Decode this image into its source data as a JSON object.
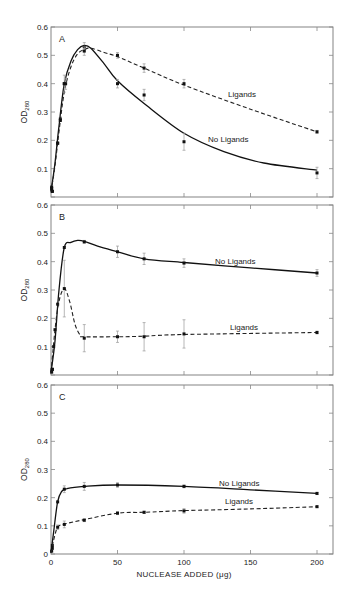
{
  "figure": {
    "x_axis_label": "NUCLEASE ADDED (μg)",
    "y_axis_label_main": "OD",
    "y_axis_label_sub": "280",
    "x_tick_labels": [
      "0",
      "50",
      "100",
      "150",
      "200"
    ],
    "y_tick_labels": [
      "0",
      "0.1",
      "0.2",
      "0.3",
      "0.4",
      "0.5",
      "0.6"
    ]
  },
  "chart_data": [
    {
      "type": "line",
      "panel": "A",
      "title": "A",
      "xlabel": "",
      "ylabel": "OD280",
      "xlim": [
        0,
        210
      ],
      "ylim": [
        0,
        0.6
      ],
      "grid": false,
      "layout": {
        "top": 27,
        "bottom": 197
      },
      "series": [
        {
          "name": "No Ligands",
          "style": "solid",
          "label_pos": [
            208,
            142
          ],
          "points": [
            {
              "x": 0.5,
              "y": 0.035
            },
            {
              "x": 1,
              "y": 0.02
            },
            {
              "x": 5,
              "y": 0.19
            },
            {
              "x": 7,
              "y": 0.275
            },
            {
              "x": 10,
              "y": 0.4
            },
            {
              "x": 25,
              "y": 0.53,
              "err": 0.015
            },
            {
              "x": 50,
              "y": 0.4,
              "err": 0.015
            },
            {
              "x": 70,
              "y": 0.36,
              "err": 0.02
            },
            {
              "x": 100,
              "y": 0.195,
              "err": 0.03
            },
            {
              "x": 200,
              "y": 0.085,
              "err": 0.02
            }
          ],
          "curve": [
            [
              0,
              0.02
            ],
            [
              3,
              0.12
            ],
            [
              6,
              0.25
            ],
            [
              10,
              0.4
            ],
            [
              15,
              0.48
            ],
            [
              20,
              0.52
            ],
            [
              25,
              0.535
            ],
            [
              30,
              0.525
            ],
            [
              40,
              0.47
            ],
            [
              50,
              0.41
            ],
            [
              70,
              0.33
            ],
            [
              100,
              0.225
            ],
            [
              130,
              0.16
            ],
            [
              160,
              0.12
            ],
            [
              200,
              0.095
            ]
          ]
        },
        {
          "name": "Ligands",
          "style": "dashed",
          "label_pos": [
            228,
            97
          ],
          "points": [
            {
              "x": 0.5,
              "y": 0.03
            },
            {
              "x": 1,
              "y": 0.02
            },
            {
              "x": 5,
              "y": 0.19
            },
            {
              "x": 7,
              "y": 0.27
            },
            {
              "x": 10,
              "y": 0.4,
              "err": 0.03
            },
            {
              "x": 11,
              "y": 0.4,
              "err": 0.02
            },
            {
              "x": 25,
              "y": 0.515,
              "err": 0.015
            },
            {
              "x": 50,
              "y": 0.5,
              "err": 0.01
            },
            {
              "x": 70,
              "y": 0.455,
              "err": 0.015
            },
            {
              "x": 100,
              "y": 0.4,
              "err": 0.015
            },
            {
              "x": 200,
              "y": 0.23,
              "err": 0.005
            }
          ],
          "curve": [
            [
              0,
              0.02
            ],
            [
              3,
              0.11
            ],
            [
              6,
              0.23
            ],
            [
              10,
              0.37
            ],
            [
              15,
              0.46
            ],
            [
              20,
              0.505
            ],
            [
              25,
              0.52
            ],
            [
              30,
              0.525
            ],
            [
              40,
              0.51
            ],
            [
              50,
              0.495
            ],
            [
              70,
              0.455
            ],
            [
              100,
              0.395
            ],
            [
              150,
              0.31
            ],
            [
              200,
              0.23
            ]
          ]
        }
      ]
    },
    {
      "type": "line",
      "panel": "B",
      "title": "B",
      "xlabel": "",
      "ylabel": "OD280",
      "xlim": [
        0,
        210
      ],
      "ylim": [
        0,
        0.6
      ],
      "grid": false,
      "layout": {
        "top": 205,
        "bottom": 375
      },
      "series": [
        {
          "name": "No Ligands",
          "style": "solid",
          "label_pos": [
            215,
            264
          ],
          "points": [
            {
              "x": 0.5,
              "y": 0.01
            },
            {
              "x": 1,
              "y": 0.02
            },
            {
              "x": 5,
              "y": 0.25
            },
            {
              "x": 10,
              "y": 0.45
            },
            {
              "x": 25,
              "y": 0.47,
              "err": 0.005
            },
            {
              "x": 50,
              "y": 0.435,
              "err": 0.02
            },
            {
              "x": 70,
              "y": 0.41,
              "err": 0.02
            },
            {
              "x": 100,
              "y": 0.395,
              "err": 0.015
            },
            {
              "x": 200,
              "y": 0.36,
              "err": 0.012
            }
          ],
          "curve": [
            [
              0,
              0.01
            ],
            [
              3,
              0.12
            ],
            [
              6,
              0.3
            ],
            [
              10,
              0.45
            ],
            [
              15,
              0.468
            ],
            [
              20,
              0.475
            ],
            [
              25,
              0.472
            ],
            [
              35,
              0.455
            ],
            [
              50,
              0.435
            ],
            [
              70,
              0.41
            ],
            [
              100,
              0.397
            ],
            [
              150,
              0.378
            ],
            [
              200,
              0.36
            ]
          ]
        },
        {
          "name": "Ligands",
          "style": "dashed",
          "label_pos": [
            230,
            330
          ],
          "points": [
            {
              "x": 1,
              "y": 0.02
            },
            {
              "x": 2,
              "y": 0.1
            },
            {
              "x": 3,
              "y": 0.16
            },
            {
              "x": 10,
              "y": 0.305,
              "err": 0.1
            },
            {
              "x": 25,
              "y": 0.13,
              "err": 0.048
            },
            {
              "x": 50,
              "y": 0.135,
              "err": 0.02
            },
            {
              "x": 70,
              "y": 0.135,
              "err": 0.05
            },
            {
              "x": 100,
              "y": 0.145,
              "err": 0.05
            },
            {
              "x": 200,
              "y": 0.15,
              "err": 0.005
            }
          ],
          "curve": [
            [
              0,
              0.01
            ],
            [
              3,
              0.16
            ],
            [
              6,
              0.26
            ],
            [
              10,
              0.305
            ],
            [
              14,
              0.26
            ],
            [
              18,
              0.18
            ],
            [
              22,
              0.14
            ],
            [
              25,
              0.135
            ],
            [
              50,
              0.135
            ],
            [
              70,
              0.137
            ],
            [
              100,
              0.143
            ],
            [
              200,
              0.15
            ]
          ]
        }
      ]
    },
    {
      "type": "line",
      "panel": "C",
      "title": "C",
      "xlabel": "NUCLEASE ADDED (μg)",
      "ylabel": "OD280",
      "xlim": [
        0,
        210
      ],
      "ylim": [
        0,
        0.6
      ],
      "grid": false,
      "layout": {
        "top": 385,
        "bottom": 554
      },
      "series": [
        {
          "name": "No Ligands",
          "style": "solid",
          "label_pos": [
            219,
            486
          ],
          "points": [
            {
              "x": 0.5,
              "y": 0.01
            },
            {
              "x": 1,
              "y": 0.03
            },
            {
              "x": 5,
              "y": 0.185
            },
            {
              "x": 10,
              "y": 0.23,
              "err": 0.012
            },
            {
              "x": 25,
              "y": 0.24,
              "err": 0.014
            },
            {
              "x": 50,
              "y": 0.245,
              "err": 0.008
            },
            {
              "x": 100,
              "y": 0.24,
              "err": 0.005
            },
            {
              "x": 200,
              "y": 0.215,
              "err": 0.004
            }
          ],
          "curve": [
            [
              0,
              0.005
            ],
            [
              2,
              0.08
            ],
            [
              5,
              0.185
            ],
            [
              8,
              0.222
            ],
            [
              12,
              0.232
            ],
            [
              25,
              0.24
            ],
            [
              50,
              0.245
            ],
            [
              100,
              0.24
            ],
            [
              150,
              0.228
            ],
            [
              200,
              0.215
            ]
          ]
        },
        {
          "name": "Ligands",
          "style": "dashed",
          "label_pos": [
            225,
            504
          ],
          "points": [
            {
              "x": 1,
              "y": 0.02
            },
            {
              "x": 5,
              "y": 0.095,
              "err": 0.008
            },
            {
              "x": 10,
              "y": 0.105,
              "err": 0.012
            },
            {
              "x": 25,
              "y": 0.12,
              "err": 0.005
            },
            {
              "x": 50,
              "y": 0.145,
              "err": 0.005
            },
            {
              "x": 70,
              "y": 0.148,
              "err": 0.004
            },
            {
              "x": 100,
              "y": 0.153,
              "err": 0.008
            },
            {
              "x": 200,
              "y": 0.168,
              "err": 0.003
            }
          ],
          "curve": [
            [
              0,
              0.005
            ],
            [
              2,
              0.05
            ],
            [
              5,
              0.095
            ],
            [
              10,
              0.106
            ],
            [
              25,
              0.122
            ],
            [
              50,
              0.145
            ],
            [
              70,
              0.148
            ],
            [
              100,
              0.154
            ],
            [
              150,
              0.16
            ],
            [
              200,
              0.168
            ]
          ]
        }
      ]
    }
  ]
}
